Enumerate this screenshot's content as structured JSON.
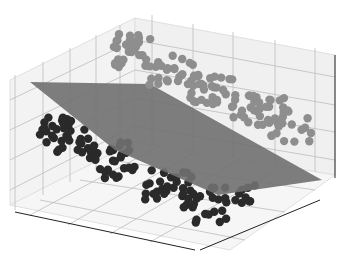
{
  "chart_data": {
    "type": "scatter",
    "projection": "3d",
    "title": "",
    "xlabel": "",
    "ylabel": "",
    "zlabel": "",
    "tick_labels_visible": false,
    "grid": true,
    "legend": null,
    "series": [
      {
        "name": "class-upper",
        "color": "#8c8c8c",
        "description": "light gray cluster above plane"
      },
      {
        "name": "class-lower",
        "color": "#2b2b2b",
        "description": "dark cluster below plane"
      }
    ],
    "separating_plane": {
      "color": "#6e6e6e",
      "opacity": 0.9
    }
  },
  "colors": {
    "upper_points": "#8e8e8e",
    "lower_points": "#2a2a2a",
    "plane": "#707070",
    "pane": "#f2f2f2",
    "grid": "#bdbdbd",
    "axis": "#222222"
  }
}
